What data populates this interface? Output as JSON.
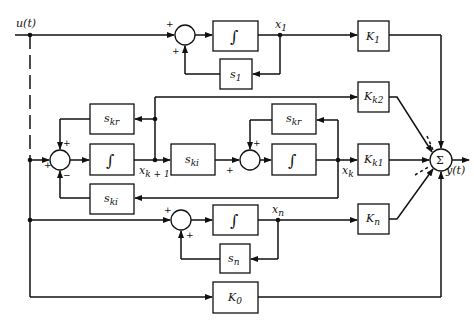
{
  "diagram": {
    "type": "block-diagram",
    "input_label": "u(t)",
    "output_label": "y(t)",
    "summer_symbol": "Σ",
    "integrator_symbol": "∫",
    "states": {
      "x1": "x",
      "x1_sub": "1",
      "xk1": "x",
      "xk1_sub": "k + 1",
      "xk": "x",
      "xk_sub": "k",
      "xn": "x",
      "xn_sub": "n"
    },
    "blocks": {
      "K1": {
        "main": "K",
        "sub": "1"
      },
      "Kk2": {
        "main": "K",
        "sub": "k2"
      },
      "Kk1": {
        "main": "K",
        "sub": "k1"
      },
      "Kn": {
        "main": "K",
        "sub": "n"
      },
      "K0": {
        "main": "K",
        "sub": "0"
      },
      "s1": {
        "main": "s",
        "sub": "1"
      },
      "sn": {
        "main": "s",
        "sub": "n"
      },
      "skr_left": {
        "main": "s",
        "sub": "kr"
      },
      "skr_right": {
        "main": "s",
        "sub": "kr"
      },
      "ski_mid": {
        "main": "s",
        "sub": "ki"
      },
      "ski_bottom": {
        "main": "s",
        "sub": "ki"
      }
    },
    "signs": {
      "plus": "+",
      "minus": "−"
    }
  }
}
